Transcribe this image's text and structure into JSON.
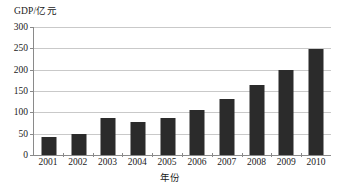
{
  "chart_data": {
    "type": "bar",
    "title": "",
    "xlabel": "年份",
    "ylabel": "GDP/亿元",
    "categories": [
      "2001",
      "2002",
      "2003",
      "2004",
      "2005",
      "2006",
      "2007",
      "2008",
      "2009",
      "2010"
    ],
    "values": [
      42,
      50,
      86,
      78,
      86,
      105,
      131,
      163,
      200,
      249
    ],
    "series": [
      {
        "name": "GDP",
        "values": [
          42,
          50,
          86,
          78,
          86,
          105,
          131,
          163,
          200,
          249
        ]
      }
    ],
    "ylim": [
      0,
      300
    ],
    "ytick_labels": [
      "0",
      "50",
      "100",
      "150",
      "200",
      "250",
      "300"
    ],
    "ytick_values": [
      0,
      50,
      100,
      150,
      200,
      250,
      300
    ],
    "grid": "horizontal",
    "legend": "none",
    "bar_color": "#2b2b2b",
    "gridline_color": "#c9c9c9",
    "axis_color": "#8a8a8a",
    "background_color": "#ffffff"
  }
}
